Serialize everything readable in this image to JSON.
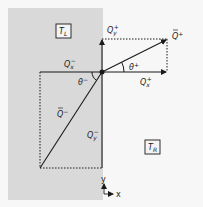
{
  "colors": {
    "background": "#f7f7f7",
    "left_region": "#d9d9d9",
    "stroke": "#1a1a1a"
  },
  "regions": {
    "left_label": "T",
    "left_sub": "L",
    "right_label": "T",
    "right_sub": "R"
  },
  "vectors": {
    "q_plus": {
      "label": "Q",
      "sup": "+"
    },
    "q_minus": {
      "label": "Q",
      "sup": "−"
    },
    "qx_plus": {
      "label": "Q",
      "sub": "x",
      "sup": "+"
    },
    "qy_plus": {
      "label": "Q",
      "sub": "y",
      "sup": "+"
    },
    "qx_minus": {
      "label": "Q",
      "sub": "x",
      "sup": "−"
    },
    "qy_minus": {
      "label": "Q",
      "sub": "y",
      "sup": "−"
    }
  },
  "angles": {
    "theta_plus": {
      "label": "θ",
      "sup": "+"
    },
    "theta_minus": {
      "label": "θ",
      "sup": "−"
    }
  },
  "axes": {
    "y_label": "y",
    "x_label": "x"
  }
}
